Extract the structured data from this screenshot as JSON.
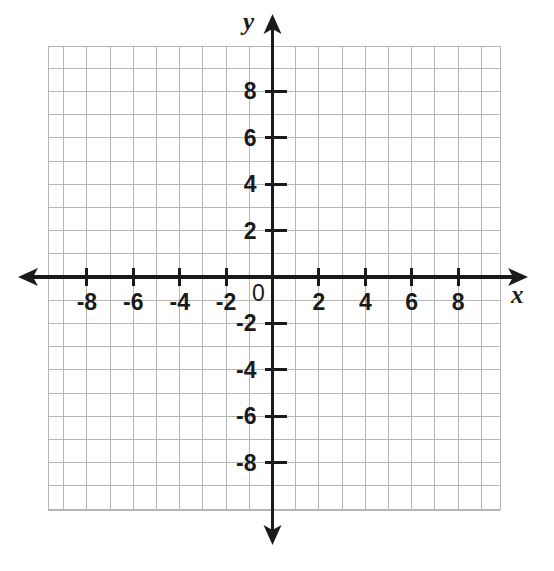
{
  "figure": {
    "kind": "coordinate-plane",
    "background_color": "#ffffff",
    "grid_color": "#b6b6b6",
    "axis_color": "#1a1a1a"
  },
  "axes": {
    "x_axis_name": "x",
    "y_axis_name": "y",
    "origin_label": "0"
  },
  "chart_data": {
    "type": "scatter",
    "title": "",
    "subtitle": "",
    "xlabel": "x",
    "ylabel": "y",
    "grid": true,
    "legend": null,
    "legend_position": "none",
    "origin_label": "0",
    "xlim": [
      -9.7,
      9.8
    ],
    "ylim": [
      -10,
      10
    ],
    "x_tick_step": 2,
    "y_tick_step": 2,
    "x_minor_step": 1,
    "y_minor_step": 1,
    "x_tick_labels": [
      "-8",
      "-6",
      "-4",
      "-2",
      "2",
      "4",
      "6",
      "8"
    ],
    "x_tick_values": [
      -8,
      -6,
      -4,
      -2,
      2,
      4,
      6,
      8
    ],
    "y_tick_labels": [
      "8",
      "6",
      "4",
      "2",
      "-2",
      "-4",
      "-6",
      "-8"
    ],
    "y_tick_values": [
      8,
      6,
      4,
      2,
      -2,
      -4,
      -6,
      -8
    ],
    "series": [],
    "points": [],
    "annotations": []
  },
  "geometry": {
    "origin_px": {
      "x": 272.5,
      "y": 277
    },
    "unit_px": 23.2,
    "grid_rect_px": {
      "left": 48,
      "top": 46,
      "right": 500,
      "bottom": 510
    },
    "x_axis_px": {
      "x1": 18,
      "x2": 528,
      "y": 277
    },
    "y_axis_px": {
      "y1": 14,
      "y2": 545,
      "x": 272.5
    }
  }
}
